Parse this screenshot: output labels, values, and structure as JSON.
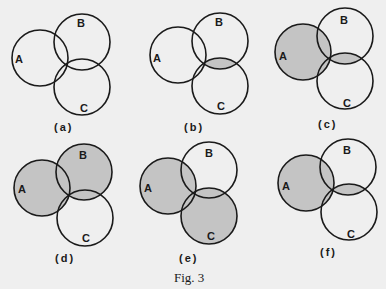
{
  "figure": {
    "caption": "Fig. 3",
    "shade_color": "#c4c4c4",
    "stroke_color": "#1a1a1a",
    "background": "#efefef"
  },
  "panels": [
    {
      "label": "(a)",
      "sets": {
        "a": "A",
        "b": "B",
        "c": "C"
      },
      "shaded": "none"
    },
    {
      "label": "(b)",
      "sets": {
        "a": "A",
        "b": "B",
        "c": "C"
      },
      "shaded": "B ∩ C"
    },
    {
      "label": "(c)",
      "sets": {
        "a": "A",
        "b": "B",
        "c": "C"
      },
      "shaded": "A ∪ (B ∩ C)"
    },
    {
      "label": "(d)",
      "sets": {
        "a": "A",
        "b": "B",
        "c": "C"
      },
      "shaded": "A ∪ B"
    },
    {
      "label": "(e)",
      "sets": {
        "a": "A",
        "b": "B",
        "c": "C"
      },
      "shaded": "A ∪ C"
    },
    {
      "label": "(f)",
      "sets": {
        "a": "A",
        "b": "B",
        "c": "C"
      },
      "shaded": "A ∪ (B ∩ C)"
    }
  ]
}
